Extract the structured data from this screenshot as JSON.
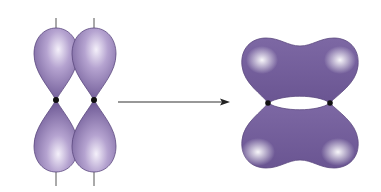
{
  "diagram": {
    "colors": {
      "lobe_dark": "#6a5592",
      "lobe_light": "#f2eef8",
      "lobe_outline": "#5d4a80",
      "nucleus": "#111111",
      "axis": "#555555",
      "arrow": "#333333"
    },
    "left": {
      "label": "two p orbitals",
      "nuclei": [
        {
          "x": 56,
          "y": 100
        },
        {
          "x": 94,
          "y": 100
        }
      ]
    },
    "arrow": {
      "x1": 118,
      "y1": 102,
      "x2": 230,
      "y2": 102
    },
    "right": {
      "label": "pi bond",
      "nuclei": [
        {
          "x": 268,
          "y": 103
        },
        {
          "x": 330,
          "y": 103
        }
      ]
    }
  }
}
